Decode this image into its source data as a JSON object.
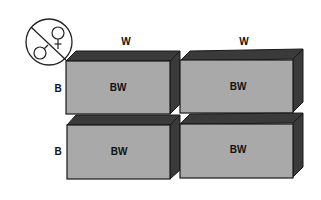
{
  "diagram": {
    "symbol": {
      "name": "male-female-crossed",
      "description": "circle containing male and female symbols separated by diagonal line"
    },
    "column_headers": [
      "W",
      "W"
    ],
    "row_headers": [
      "B",
      "B"
    ],
    "cells": [
      [
        "BW",
        "BW"
      ],
      [
        "BW",
        "BW"
      ]
    ],
    "colors": {
      "front_face": "#a9a9a9",
      "top_side": "#3a3a3a",
      "outline": "#1a1a1a",
      "background": "#ffffff"
    }
  }
}
